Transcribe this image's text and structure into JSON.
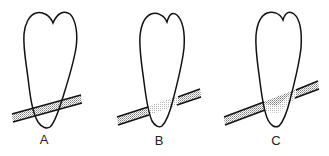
{
  "figure": {
    "type": "diagram",
    "stroke_color": "#111111",
    "fill_pattern_color": "#9a9a9a",
    "panels": [
      {
        "id": "A",
        "label": "A"
      },
      {
        "id": "B",
        "label": "B"
      },
      {
        "id": "C",
        "label": "C"
      }
    ]
  }
}
